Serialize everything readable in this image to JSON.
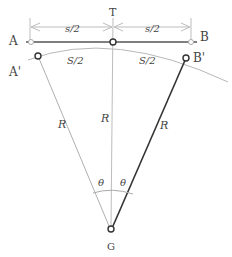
{
  "diagram": {
    "title_point": "T",
    "points": {
      "A": "A",
      "B": "B",
      "A_prime": "A'",
      "B_prime": "B'",
      "G": "G"
    },
    "dimensions": {
      "half_chord_left": "s/2",
      "half_chord_right": "s/2",
      "half_arc_left": "S/2",
      "half_arc_right": "S/2"
    },
    "radius_labels": {
      "left": "R",
      "center": "R",
      "right": "R"
    },
    "angle_labels": {
      "left": "θ",
      "right": "θ"
    },
    "colors": {
      "line_dark": "#333333",
      "line_light": "#aaaaaa",
      "text": "#444444"
    }
  }
}
